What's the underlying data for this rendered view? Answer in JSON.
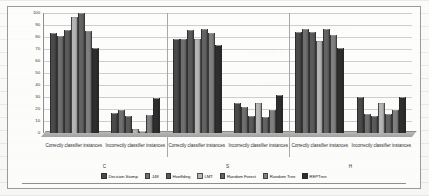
{
  "chart_data": {
    "type": "bar",
    "title": "",
    "subtitle": "",
    "xlabel": "",
    "ylabel": "",
    "ylim": [
      0,
      100
    ],
    "yticks": [
      0,
      10,
      20,
      30,
      40,
      50,
      60,
      70,
      80,
      90,
      100
    ],
    "grid": true,
    "legend_position": "bottom",
    "categories": [
      "Correctly classifier instances",
      "Incorrectly classifier instances",
      "Correctly classifier instances",
      "Incorrectly classifier instances",
      "Correctly classifier instances",
      "Incorrectly classifier instances"
    ],
    "group_labels": [
      "C",
      "S",
      "H"
    ],
    "series": [
      {
        "name": "Decision Stump",
        "color": "#4a4a4a",
        "values": [
          83,
          17,
          78,
          25,
          84,
          30
        ]
      },
      {
        "name": "J48",
        "color": "#6f6f6f",
        "values": [
          81,
          19,
          78,
          22,
          87,
          16
        ]
      },
      {
        "name": "Hoeffding",
        "color": "#5a5a5a",
        "values": [
          86,
          14,
          86,
          14,
          84,
          14
        ]
      },
      {
        "name": "LMT",
        "color": "#b5b5b5",
        "values": [
          97,
          3,
          78,
          25,
          77,
          25
        ]
      },
      {
        "name": "Random Forest",
        "color": "#636363",
        "values": [
          100,
          0,
          87,
          13,
          87,
          16
        ]
      },
      {
        "name": "Random Tree",
        "color": "#808080",
        "values": [
          85,
          15,
          83,
          19,
          82,
          19
        ]
      },
      {
        "name": "REPTree",
        "color": "#2e2e2e",
        "values": [
          71,
          29,
          73,
          32,
          71,
          30
        ]
      }
    ]
  },
  "axis": {
    "y_ticks": [
      "100",
      "90",
      "80",
      "70",
      "60",
      "50",
      "40",
      "30",
      "20",
      "10",
      "0"
    ]
  },
  "legend": {
    "items": [
      {
        "label": "Decision Stump"
      },
      {
        "label": "J48"
      },
      {
        "label": "Hoeffding"
      },
      {
        "label": "LMT"
      },
      {
        "label": "Random Forest"
      },
      {
        "label": "Random Tree"
      },
      {
        "label": "REPTree"
      }
    ]
  },
  "background_text": {
    "a": "he his nor",
    "b": "under hip",
    "c": "ma-",
    "d": "ricter-bay as",
    "e": "unsans ono"
  }
}
